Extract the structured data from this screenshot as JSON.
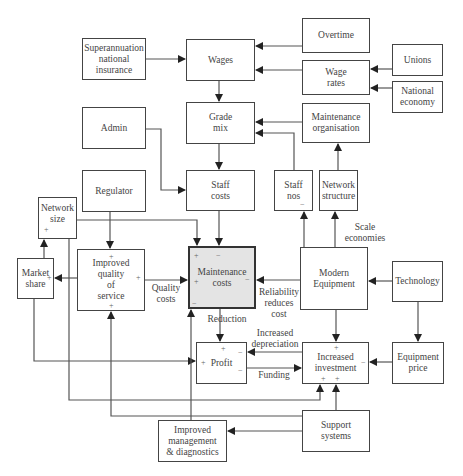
{
  "diagram": {
    "nodes": {
      "superannuation": {
        "label": "Superannuation\nnational\ninsurance"
      },
      "wages": {
        "label": "Wages"
      },
      "overtime": {
        "label": "Overtime"
      },
      "wage_rates": {
        "label": "Wage\nrates"
      },
      "unions": {
        "label": "Unions"
      },
      "national_economy": {
        "label": "National\neconomy"
      },
      "admin": {
        "label": "Admin"
      },
      "grade_mix": {
        "label": "Grade\nmix"
      },
      "maintenance_organisation": {
        "label": "Maintenance\norganisation"
      },
      "regulator": {
        "label": "Regulator"
      },
      "staff_costs": {
        "label": "Staff\ncosts"
      },
      "staff_nos": {
        "label": "Staff\nnos"
      },
      "network_structure": {
        "label": "Network\nstructure"
      },
      "network_size": {
        "label": "Network\nsize"
      },
      "market_share": {
        "label": "Market\nshare"
      },
      "improved_quality": {
        "label": "Improved\nquality\nof\nservice"
      },
      "maintenance_costs": {
        "label": "Maintenance\ncosts"
      },
      "modern_equipment": {
        "label": "Modern\nEquipment"
      },
      "technology": {
        "label": "Technology"
      },
      "profit": {
        "label": "Profit"
      },
      "increased_investment": {
        "label": "Increased\ninvestment"
      },
      "equipment_price": {
        "label": "Equipment\nprice"
      },
      "improved_management": {
        "label": "Improved\nmanagement\n& diagnostics"
      },
      "support_systems": {
        "label": "Support\nsystems"
      }
    },
    "edge_labels": {
      "scale_economies": "Scale\neconomies",
      "quality_costs": "Quality\ncosts",
      "reliability": "Reliability\nreduces\ncost",
      "reduction": "Reduction",
      "increased_depreciation": "Increased\ndepreciation",
      "funding": "Funding"
    },
    "signs": {
      "plus": "+",
      "minus": "−"
    },
    "colors": {
      "line": "#444444",
      "highlight_fill": "#e4e4e4"
    }
  }
}
